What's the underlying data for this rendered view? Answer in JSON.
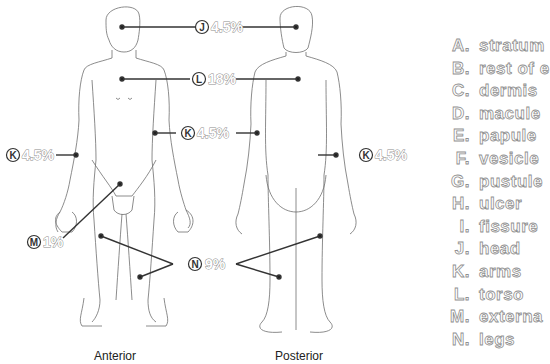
{
  "figure": {
    "views": [
      {
        "id": "anterior",
        "caption": "Anterior"
      },
      {
        "id": "posterior",
        "caption": "Posterior"
      }
    ],
    "callouts": [
      {
        "letter": "J",
        "value": "4.5%",
        "region": "head"
      },
      {
        "letter": "L",
        "value": "18%",
        "region": "torso"
      },
      {
        "letter": "K",
        "value": "4.5%",
        "region": "arm-anterior-right"
      },
      {
        "letter": "K",
        "value": "4.5%",
        "region": "arm-anterior-left"
      },
      {
        "letter": "K",
        "value": "4.5%",
        "region": "arm-posterior"
      },
      {
        "letter": "M",
        "value": "1%",
        "region": "external genitalia"
      },
      {
        "letter": "N",
        "value": "9%",
        "region": "legs"
      }
    ]
  },
  "legend": {
    "items": [
      {
        "letter": "A.",
        "text": "stratum"
      },
      {
        "letter": "B.",
        "text": "rest of e"
      },
      {
        "letter": "C.",
        "text": "dermis"
      },
      {
        "letter": "D.",
        "text": "macule"
      },
      {
        "letter": "E.",
        "text": "papule"
      },
      {
        "letter": "F.",
        "text": "vesicle"
      },
      {
        "letter": "G.",
        "text": "pustule"
      },
      {
        "letter": "H.",
        "text": "ulcer"
      },
      {
        "letter": "I.",
        "text": "fissure"
      },
      {
        "letter": "J.",
        "text": "head"
      },
      {
        "letter": "K.",
        "text": "arms"
      },
      {
        "letter": "L.",
        "text": "torso"
      },
      {
        "letter": "M.",
        "text": "externa"
      },
      {
        "letter": "N.",
        "text": "legs"
      }
    ]
  },
  "colors": {
    "line": "#333333",
    "outline": "#6e6e6e",
    "text_stroke": "#8a8a8a"
  }
}
